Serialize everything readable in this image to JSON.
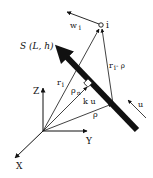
{
  "diagram": {
    "type": "vector-geometry",
    "colors": {
      "ink": "#111111",
      "background": "#ffffff"
    },
    "axes": {
      "z": {
        "label": "Z"
      },
      "y": {
        "label": "Y"
      },
      "x": {
        "label": "X"
      }
    },
    "segment": {
      "label": "S (L, h)"
    },
    "point": {
      "label": "i"
    },
    "vectors": {
      "w": {
        "label": "w",
        "sub": "i"
      },
      "r": {
        "label": "r",
        "sub": "i"
      },
      "r_minus_rho": {
        "label": "r",
        "sub": "i",
        "suffix": "- ρ"
      },
      "rho": {
        "label": "ρ"
      },
      "rho_n": {
        "label": "ρ",
        "sub": "n"
      },
      "ku": {
        "label": "k u"
      },
      "u": {
        "label": "u"
      }
    }
  }
}
